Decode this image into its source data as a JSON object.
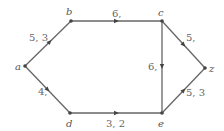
{
  "diagram": {
    "type": "directed-graph",
    "nodes": [
      {
        "id": "a",
        "label": "a",
        "x": 25,
        "y": 66
      },
      {
        "id": "b",
        "label": "b",
        "x": 71,
        "y": 21
      },
      {
        "id": "c",
        "label": "c",
        "x": 162,
        "y": 21
      },
      {
        "id": "d",
        "label": "d",
        "x": 70,
        "y": 113
      },
      {
        "id": "e",
        "label": "e",
        "x": 162,
        "y": 113
      },
      {
        "id": "z",
        "label": "z",
        "x": 205,
        "y": 68
      }
    ],
    "edges": [
      {
        "from": "a",
        "to": "b",
        "label": "5, 3"
      },
      {
        "from": "b",
        "to": "c",
        "label": "6,"
      },
      {
        "from": "c",
        "to": "z",
        "label": "5,"
      },
      {
        "from": "c",
        "to": "e",
        "label": "6,"
      },
      {
        "from": "a",
        "to": "d",
        "label": "4,"
      },
      {
        "from": "d",
        "to": "e",
        "label": "3, 2"
      },
      {
        "from": "e",
        "to": "z",
        "label": "5, 3"
      }
    ]
  }
}
